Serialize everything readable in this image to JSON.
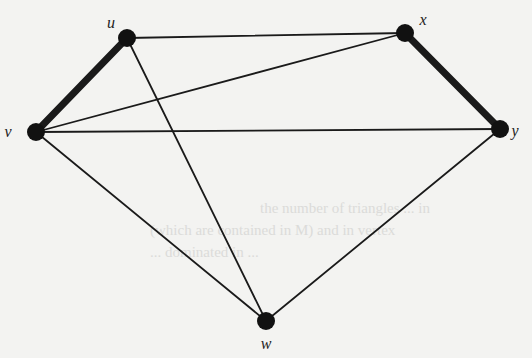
{
  "diagram": {
    "type": "graph",
    "nodes": [
      {
        "id": "u",
        "label": "u"
      },
      {
        "id": "x",
        "label": "x"
      },
      {
        "id": "v",
        "label": "v"
      },
      {
        "id": "y",
        "label": "y"
      },
      {
        "id": "w",
        "label": "w"
      }
    ],
    "edges": [
      {
        "from": "u",
        "to": "x",
        "bold": false
      },
      {
        "from": "u",
        "to": "v",
        "bold": true
      },
      {
        "from": "u",
        "to": "w",
        "bold": false
      },
      {
        "from": "x",
        "to": "v",
        "bold": false
      },
      {
        "from": "x",
        "to": "y",
        "bold": true
      },
      {
        "from": "v",
        "to": "y",
        "bold": false
      },
      {
        "from": "v",
        "to": "w",
        "bold": false
      },
      {
        "from": "y",
        "to": "w",
        "bold": false
      }
    ],
    "colors": {
      "edge": "#1a1a1a",
      "node": "#111111",
      "background": "#f3f3f1"
    }
  },
  "bleed_through": {
    "line1": "the number of triangles ... in",
    "line2": "(which are contained in M) and in vertex",
    "line3": "... dominated in ..."
  }
}
